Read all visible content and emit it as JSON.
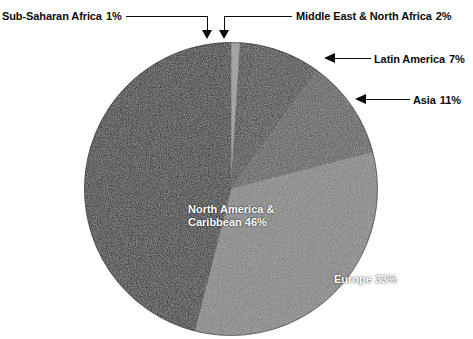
{
  "chart_data": {
    "type": "pie",
    "title": "",
    "categories": [
      "Sub-Saharan Africa",
      "Middle East & North Africa",
      "Latin America",
      "Asia",
      "Europe",
      "North America & Caribbean"
    ],
    "values": [
      1,
      2,
      7,
      11,
      33,
      46
    ],
    "value_unit": "%",
    "start_angle_deg": 0,
    "direction": "clockwise",
    "legend": "none",
    "grid": false,
    "slices": [
      {
        "label": "Sub-Saharan Africa",
        "value": 1,
        "display": "1%",
        "color": "#8e8e8e",
        "label_style": "callout",
        "callout_side": "left"
      },
      {
        "label": "Middle East & North Africa",
        "value": 2,
        "display": "2%",
        "color": "#1f1f1f",
        "label_style": "callout",
        "callout_side": "right"
      },
      {
        "label": "Latin America",
        "value": 7,
        "display": "7%",
        "color": "#2b2b2b",
        "label_style": "callout",
        "callout_side": "right"
      },
      {
        "label": "Asia",
        "value": 11,
        "display": "11%",
        "color": "#4a4a4a",
        "label_style": "callout",
        "callout_side": "right"
      },
      {
        "label": "Europe",
        "value": 33,
        "display": "33%",
        "color": "#777777",
        "label_style": "inline",
        "callout_side": "none"
      },
      {
        "label": "North America & Caribbean",
        "value": 46,
        "display": "46%",
        "color": "#101010",
        "label_style": "inline",
        "callout_side": "none"
      }
    ]
  },
  "labels": {
    "sub_saharan_africa": {
      "name": "Sub-Saharan Africa",
      "pct": "1%"
    },
    "middle_east_north_africa": {
      "name": "Middle East & North Africa",
      "pct": "2%"
    },
    "latin_america": {
      "name": "Latin America",
      "pct": "7%"
    },
    "asia": {
      "name": "Asia",
      "pct": "11%"
    },
    "europe_inline": "Europe 33%",
    "north_america_line1": "North America &",
    "north_america_line2": "Caribbean  46%"
  },
  "colors": {
    "background": "#ffffff",
    "text": "#0b0b0b",
    "inline_text": "#ffffff",
    "leader": "#0b0b0b"
  }
}
